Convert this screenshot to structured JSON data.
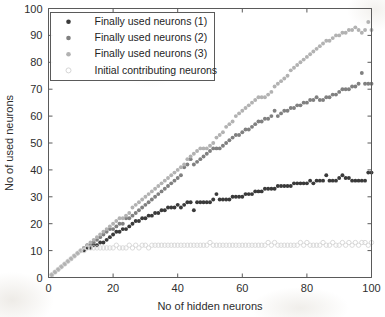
{
  "chart_data": {
    "type": "scatter",
    "title": "",
    "xlabel": "No of hidden neurons",
    "ylabel": "No of used neurons",
    "xlim": [
      0,
      100
    ],
    "ylim": [
      0,
      100
    ],
    "xticks": [
      0,
      20,
      40,
      60,
      80,
      100
    ],
    "yticks": [
      0,
      10,
      20,
      30,
      40,
      50,
      60,
      70,
      80,
      90,
      100
    ],
    "grid": false,
    "legend_position": "upper-left",
    "marker": "filled-circle",
    "series": [
      {
        "name": "Finally used neurons (1)",
        "color": "#3a3a3a",
        "marker": "filled-circle",
        "x": [
          1,
          2,
          3,
          4,
          5,
          6,
          7,
          8,
          9,
          10,
          11,
          12,
          13,
          14,
          15,
          16,
          17,
          18,
          19,
          20,
          21,
          22,
          23,
          24,
          25,
          26,
          27,
          28,
          29,
          30,
          31,
          32,
          33,
          34,
          35,
          36,
          37,
          38,
          39,
          40,
          41,
          42,
          43,
          44,
          45,
          46,
          47,
          48,
          49,
          50,
          51,
          52,
          53,
          54,
          55,
          56,
          57,
          58,
          59,
          60,
          61,
          62,
          63,
          64,
          65,
          66,
          67,
          68,
          69,
          70,
          71,
          72,
          73,
          74,
          75,
          76,
          77,
          78,
          79,
          80,
          81,
          82,
          83,
          84,
          85,
          86,
          87,
          88,
          89,
          90,
          91,
          92,
          93,
          94,
          95,
          96,
          97,
          98,
          99,
          100
        ],
        "y": [
          1,
          2,
          3,
          4,
          5,
          6,
          7,
          8,
          9,
          10,
          10,
          11,
          11,
          12,
          12,
          13,
          13,
          14,
          15,
          16,
          17,
          17,
          18,
          18,
          19,
          20,
          21,
          21,
          22,
          22,
          23,
          23,
          24,
          24,
          25,
          25,
          26,
          26,
          26,
          27,
          26,
          27,
          28,
          28,
          25,
          28,
          28,
          28,
          28,
          28,
          29,
          31,
          29,
          29,
          29,
          29,
          30,
          30,
          30,
          30,
          31,
          31,
          31,
          32,
          32,
          32,
          33,
          33,
          33,
          33,
          34,
          34,
          34,
          34,
          34,
          35,
          35,
          35,
          35,
          35,
          36,
          35,
          36,
          36,
          36,
          38,
          36,
          36,
          36,
          37,
          38,
          37,
          37,
          36,
          36,
          36,
          36,
          36,
          39,
          39
        ]
      },
      {
        "name": "Finally used neurons (2)",
        "color": "#808080",
        "marker": "filled-circle",
        "x": [
          1,
          2,
          3,
          4,
          5,
          6,
          7,
          8,
          9,
          10,
          11,
          12,
          13,
          14,
          15,
          16,
          17,
          18,
          19,
          20,
          21,
          22,
          23,
          24,
          25,
          26,
          27,
          28,
          29,
          30,
          31,
          32,
          33,
          34,
          35,
          36,
          37,
          38,
          39,
          40,
          41,
          42,
          43,
          44,
          45,
          46,
          47,
          48,
          49,
          50,
          51,
          52,
          53,
          54,
          55,
          56,
          57,
          58,
          59,
          60,
          61,
          62,
          63,
          64,
          65,
          66,
          67,
          68,
          69,
          70,
          71,
          72,
          73,
          74,
          75,
          76,
          77,
          78,
          79,
          80,
          81,
          82,
          83,
          84,
          85,
          86,
          87,
          88,
          89,
          90,
          91,
          92,
          93,
          94,
          95,
          96,
          97,
          98,
          99,
          100
        ],
        "y": [
          1,
          2,
          3,
          4,
          5,
          6,
          7,
          8,
          9,
          10,
          11,
          12,
          12,
          13,
          14,
          15,
          16,
          17,
          18,
          18,
          19,
          20,
          20,
          22,
          22,
          23,
          24,
          25,
          26,
          27,
          28,
          29,
          30,
          31,
          32,
          33,
          34,
          35,
          36,
          37,
          38,
          41,
          42,
          44,
          42,
          43,
          44,
          45,
          46,
          47,
          48,
          48,
          48,
          49,
          50,
          51,
          52,
          53,
          53,
          54,
          55,
          55,
          56,
          57,
          58,
          58,
          59,
          59,
          60,
          62,
          60,
          61,
          62,
          62,
          63,
          63,
          64,
          64,
          65,
          65,
          66,
          66,
          67,
          66,
          66,
          67,
          67,
          68,
          68,
          69,
          70,
          70,
          70,
          71,
          71,
          72,
          76,
          72,
          72,
          72
        ]
      },
      {
        "name": "Finally used neurons (3)",
        "color": "#b2b2b2",
        "marker": "filled-circle",
        "x": [
          1,
          2,
          3,
          4,
          5,
          6,
          7,
          8,
          9,
          10,
          11,
          12,
          13,
          14,
          15,
          16,
          17,
          18,
          19,
          20,
          21,
          22,
          23,
          24,
          25,
          26,
          27,
          28,
          29,
          30,
          31,
          32,
          33,
          34,
          35,
          36,
          37,
          38,
          39,
          40,
          41,
          42,
          43,
          44,
          45,
          46,
          47,
          48,
          49,
          50,
          51,
          52,
          53,
          54,
          55,
          56,
          57,
          58,
          59,
          60,
          61,
          62,
          63,
          64,
          65,
          66,
          67,
          68,
          69,
          70,
          71,
          72,
          73,
          74,
          75,
          76,
          77,
          78,
          79,
          80,
          81,
          82,
          83,
          84,
          85,
          86,
          87,
          88,
          89,
          90,
          91,
          92,
          93,
          94,
          95,
          96,
          97,
          98,
          99,
          100
        ],
        "y": [
          1,
          2,
          3,
          4,
          5,
          6,
          7,
          8,
          9,
          10,
          11,
          12,
          13,
          14,
          15,
          16,
          17,
          18,
          19,
          20,
          21,
          22,
          22,
          23,
          24,
          26,
          27,
          28,
          29,
          30,
          31,
          32,
          33,
          34,
          35,
          36,
          37,
          38,
          39,
          40,
          41,
          42,
          44,
          45,
          46,
          47,
          48,
          48,
          48,
          49,
          50,
          52,
          53,
          54,
          56,
          57,
          58,
          60,
          61,
          62,
          63,
          64,
          65,
          66,
          67,
          67,
          67,
          68,
          69,
          71,
          72,
          73,
          74,
          75,
          77,
          78,
          79,
          80,
          81,
          82,
          83,
          84,
          85,
          86,
          87,
          88,
          88,
          89,
          90,
          90,
          91,
          91,
          92,
          92,
          93,
          92,
          91,
          92,
          95,
          92
        ]
      },
      {
        "name": "Initial contributing neurons",
        "color": "#d6d6d6",
        "marker": "open-circle",
        "x": [
          1,
          2,
          3,
          4,
          5,
          6,
          7,
          8,
          9,
          10,
          11,
          12,
          13,
          14,
          15,
          16,
          17,
          18,
          19,
          20,
          21,
          22,
          23,
          24,
          25,
          26,
          27,
          28,
          29,
          30,
          31,
          32,
          33,
          34,
          35,
          36,
          37,
          38,
          39,
          40,
          41,
          42,
          43,
          44,
          45,
          46,
          47,
          48,
          49,
          50,
          51,
          52,
          53,
          54,
          55,
          56,
          57,
          58,
          59,
          60,
          61,
          62,
          63,
          64,
          65,
          66,
          67,
          68,
          69,
          70,
          71,
          72,
          73,
          74,
          75,
          76,
          77,
          78,
          79,
          80,
          81,
          82,
          83,
          84,
          85,
          86,
          87,
          88,
          89,
          90,
          91,
          92,
          93,
          94,
          95,
          96,
          97,
          98,
          99,
          100
        ],
        "y": [
          1,
          2,
          3,
          4,
          5,
          6,
          7,
          8,
          9,
          10,
          10,
          11,
          11,
          11,
          11,
          11,
          11,
          11,
          11,
          11,
          12,
          11,
          11,
          11,
          12,
          11,
          12,
          11,
          12,
          12,
          11,
          12,
          12,
          12,
          12,
          12,
          12,
          12,
          12,
          12,
          12,
          12,
          12,
          12,
          12,
          12,
          12,
          12,
          12,
          13,
          12,
          12,
          12,
          12,
          12,
          12,
          12,
          12,
          12,
          12,
          12,
          12,
          12,
          12,
          12,
          12,
          12,
          13,
          12,
          13,
          12,
          12,
          12,
          12,
          12,
          12,
          12,
          13,
          12,
          13,
          12,
          12,
          12,
          12,
          13,
          12,
          12,
          13,
          12,
          12,
          13,
          12,
          13,
          12,
          13,
          12,
          13,
          13,
          12,
          13
        ]
      }
    ]
  },
  "legend": {
    "entries": [
      {
        "label": "Finally used neurons (1)"
      },
      {
        "label": "Finally used neurons (2)"
      },
      {
        "label": "Finally used neurons (3)"
      },
      {
        "label": "Initial contributing neurons"
      }
    ]
  },
  "axes": {
    "x_label": "No of hidden neurons",
    "y_label": "No of used neurons",
    "x_tick_labels": [
      "0",
      "20",
      "40",
      "60",
      "80",
      "100"
    ],
    "y_tick_labels": [
      "0",
      "10",
      "20",
      "30",
      "40",
      "50",
      "60",
      "70",
      "80",
      "90",
      "100"
    ]
  },
  "colors": {
    "series1": "#3a3a3a",
    "series2": "#808080",
    "series3": "#b2b2b2",
    "series4": "#d6d6d6",
    "axis": "#5a5a5a",
    "text": "#2e2e2e",
    "background": "#ffffff"
  }
}
